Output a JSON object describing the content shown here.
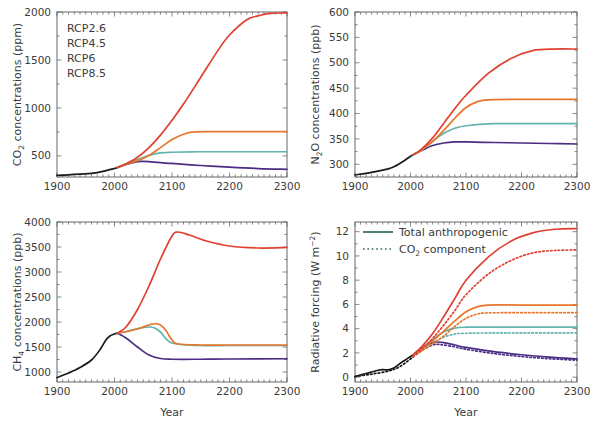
{
  "figure": {
    "title": "",
    "panels": [
      {
        "id": "co2",
        "ylabel_main": "CO",
        "ylabel_sub": "2",
        "ylabel_rest": " concentrations (ppm)",
        "xlabel": ""
      },
      {
        "id": "n2o",
        "ylabel_main": "N",
        "ylabel_sub": "2",
        "ylabel_mid": "O",
        "ylabel_rest": " concentrations (ppb)",
        "xlabel": ""
      },
      {
        "id": "ch4",
        "ylabel_main": "CH",
        "ylabel_sub": "4",
        "ylabel_rest": " concentrations (ppb)",
        "xlabel": "Year"
      },
      {
        "id": "rf",
        "ylabel_main": "Radiative forcing (W m",
        "ylabel_sup": "−2",
        "ylabel_rest": ")",
        "xlabel": "Year"
      }
    ]
  },
  "legend_scenarios": {
    "items": [
      {
        "label": "RCP2.6",
        "color": "#4b2d83"
      },
      {
        "label": "RCP4.5",
        "color": "#63b5ae"
      },
      {
        "label": "RCP6",
        "color": "#e8762c"
      },
      {
        "label": "RCP8.5",
        "color": "#e04030"
      }
    ]
  },
  "legend_forcing": {
    "items": [
      {
        "label": "Total anthropogenic",
        "style": "solid",
        "color": "#2f6b4f"
      },
      {
        "label": "CO",
        "sublabel": "2",
        "label_rest": " component",
        "style": "dotted",
        "color": "#2f6b4f"
      }
    ]
  },
  "colors": {
    "historical": "#1a1a1a",
    "rcp26": "#4b2d83",
    "rcp45": "#63b5ae",
    "rcp6": "#e8762c",
    "rcp85": "#e04030",
    "axis": "#58585a",
    "legend_green": "#2f6b4f"
  },
  "chart_data": [
    {
      "type": "line",
      "id": "co2",
      "title": "",
      "xlabel": "",
      "ylabel": "CO2 concentrations (ppm)",
      "xlim": [
        1900,
        2300
      ],
      "ylim": [
        280,
        2000
      ],
      "xticks": [
        1900,
        2000,
        2100,
        2200,
        2300
      ],
      "yticks": [
        500,
        1000,
        1500,
        2000
      ],
      "grid": false,
      "legend_position": "upper-left",
      "series": [
        {
          "name": "Historical",
          "color": "#1a1a1a",
          "x": [
            1900,
            1920,
            1940,
            1960,
            1980,
            1990,
            2000,
            2005
          ],
          "values": [
            296,
            303,
            311,
            317,
            339,
            354,
            369,
            379
          ]
        },
        {
          "name": "RCP2.6",
          "color": "#4b2d83",
          "x": [
            2005,
            2020,
            2040,
            2050,
            2060,
            2080,
            2100,
            2150,
            2200,
            2250,
            2300
          ],
          "values": [
            379,
            412,
            440,
            443,
            440,
            429,
            421,
            400,
            382,
            368,
            360
          ]
        },
        {
          "name": "RCP4.5",
          "color": "#63b5ae",
          "x": [
            2005,
            2020,
            2040,
            2060,
            2080,
            2100,
            2150,
            2200,
            2250,
            2300
          ],
          "values": [
            379,
            415,
            461,
            506,
            531,
            538,
            543,
            543,
            543,
            543
          ]
        },
        {
          "name": "RCP6",
          "color": "#e8762c",
          "x": [
            2005,
            2020,
            2040,
            2060,
            2080,
            2100,
            2120,
            2140,
            2200,
            2250,
            2300
          ],
          "values": [
            379,
            412,
            449,
            505,
            586,
            670,
            725,
            751,
            752,
            752,
            752
          ]
        },
        {
          "name": "RCP8.5",
          "color": "#e04030",
          "x": [
            2005,
            2020,
            2040,
            2060,
            2080,
            2100,
            2120,
            2150,
            2180,
            2200,
            2230,
            2250,
            2270,
            2300
          ],
          "values": [
            379,
            417,
            486,
            587,
            717,
            871,
            1040,
            1320,
            1600,
            1760,
            1920,
            1960,
            1985,
            1990
          ]
        }
      ]
    },
    {
      "type": "line",
      "id": "n2o",
      "title": "",
      "xlabel": "",
      "ylabel": "N2O concentrations (ppb)",
      "xlim": [
        1900,
        2300
      ],
      "ylim": [
        275,
        600
      ],
      "xticks": [
        1900,
        2000,
        2100,
        2200,
        2300
      ],
      "yticks": [
        300,
        350,
        400,
        450,
        500,
        550,
        600
      ],
      "grid": false,
      "series": [
        {
          "name": "Historical",
          "color": "#1a1a1a",
          "x": [
            1900,
            1930,
            1960,
            1970,
            1980,
            1990,
            2000,
            2005
          ],
          "values": [
            279,
            284,
            291,
            295,
            301,
            308,
            316,
            319
          ]
        },
        {
          "name": "RCP2.6",
          "color": "#4b2d83",
          "x": [
            2005,
            2020,
            2040,
            2060,
            2080,
            2100,
            2150,
            2200,
            2250,
            2300
          ],
          "values": [
            319,
            327,
            337,
            342,
            344,
            344,
            343,
            342,
            341,
            340
          ]
        },
        {
          "name": "RCP4.5",
          "color": "#63b5ae",
          "x": [
            2005,
            2020,
            2040,
            2060,
            2080,
            2100,
            2150,
            2200,
            2250,
            2300
          ],
          "values": [
            319,
            328,
            345,
            361,
            371,
            376,
            380,
            380,
            380,
            380
          ]
        },
        {
          "name": "RCP6",
          "color": "#e8762c",
          "x": [
            2005,
            2020,
            2040,
            2060,
            2080,
            2100,
            2120,
            2140,
            2200,
            2300
          ],
          "values": [
            319,
            328,
            345,
            367,
            391,
            412,
            423,
            427,
            428,
            428
          ]
        },
        {
          "name": "RCP8.5",
          "color": "#e04030",
          "x": [
            2005,
            2020,
            2040,
            2060,
            2080,
            2100,
            2140,
            2180,
            2220,
            2260,
            2300
          ],
          "values": [
            319,
            330,
            352,
            381,
            410,
            436,
            479,
            508,
            524,
            527,
            527
          ]
        }
      ]
    },
    {
      "type": "line",
      "id": "ch4",
      "title": "",
      "xlabel": "Year",
      "ylabel": "CH4 concentrations (ppb)",
      "xlim": [
        1900,
        2300
      ],
      "ylim": [
        800,
        4000
      ],
      "xticks": [
        1900,
        2000,
        2100,
        2200,
        2300
      ],
      "yticks": [
        1000,
        1500,
        2000,
        2500,
        3000,
        3500,
        4000
      ],
      "grid": false,
      "series": [
        {
          "name": "Historical",
          "color": "#1a1a1a",
          "x": [
            1900,
            1920,
            1940,
            1960,
            1975,
            1985,
            1992,
            2000,
            2005
          ],
          "values": [
            890,
            980,
            1090,
            1240,
            1450,
            1640,
            1720,
            1760,
            1775
          ]
        },
        {
          "name": "RCP2.6",
          "color": "#4b2d83",
          "x": [
            2005,
            2020,
            2040,
            2060,
            2080,
            2100,
            2150,
            2200,
            2300
          ],
          "values": [
            1775,
            1680,
            1500,
            1340,
            1270,
            1255,
            1255,
            1260,
            1265
          ]
        },
        {
          "name": "RCP4.5",
          "color": "#63b5ae",
          "x": [
            2005,
            2020,
            2040,
            2060,
            2070,
            2080,
            2100,
            2150,
            2200,
            2300
          ],
          "values": [
            1775,
            1810,
            1870,
            1900,
            1880,
            1800,
            1580,
            1530,
            1530,
            1530
          ]
        },
        {
          "name": "RCP6",
          "color": "#e8762c",
          "x": [
            2005,
            2020,
            2040,
            2060,
            2070,
            2080,
            2090,
            2100,
            2110,
            2150,
            2200,
            2300
          ],
          "values": [
            1775,
            1805,
            1860,
            1940,
            1965,
            1940,
            1820,
            1640,
            1560,
            1540,
            1540,
            1540
          ]
        },
        {
          "name": "RCP8.5",
          "color": "#e04030",
          "x": [
            2005,
            2020,
            2040,
            2060,
            2080,
            2100,
            2110,
            2130,
            2160,
            2200,
            2250,
            2300
          ],
          "values": [
            1775,
            1900,
            2250,
            2720,
            3260,
            3720,
            3800,
            3740,
            3620,
            3520,
            3480,
            3490
          ]
        }
      ]
    },
    {
      "type": "line",
      "id": "rf",
      "title": "",
      "xlabel": "Year",
      "ylabel": "Radiative forcing (W m-2)",
      "xlim": [
        1900,
        2300
      ],
      "ylim": [
        -0.4,
        12.8
      ],
      "xticks": [
        1900,
        2000,
        2100,
        2200,
        2300
      ],
      "yticks": [
        0,
        2,
        4,
        6,
        8,
        10,
        12
      ],
      "grid": false,
      "legend_position": "upper-left",
      "series": [
        {
          "name": "Historical total",
          "color": "#1a1a1a",
          "style": "solid",
          "x": [
            1900,
            1920,
            1940,
            1950,
            1960,
            1970,
            1980,
            1990,
            2000,
            2005
          ],
          "values": [
            0.05,
            0.3,
            0.55,
            0.62,
            0.6,
            0.75,
            1.1,
            1.4,
            1.7,
            1.85
          ]
        },
        {
          "name": "Historical CO2",
          "color": "#1a1a1a",
          "style": "dotted",
          "x": [
            1900,
            1930,
            1960,
            1980,
            2000,
            2005
          ],
          "values": [
            0.05,
            0.25,
            0.5,
            0.85,
            1.5,
            1.7
          ]
        },
        {
          "name": "RCP2.6 total",
          "color": "#4b2d83",
          "style": "solid",
          "x": [
            2005,
            2020,
            2040,
            2050,
            2060,
            2080,
            2100,
            2150,
            2200,
            2250,
            2300
          ],
          "values": [
            1.85,
            2.4,
            2.85,
            2.9,
            2.85,
            2.65,
            2.45,
            2.1,
            1.85,
            1.65,
            1.5
          ]
        },
        {
          "name": "RCP2.6 CO2",
          "color": "#4b2d83",
          "style": "dotted",
          "x": [
            2005,
            2020,
            2040,
            2050,
            2060,
            2080,
            2100,
            2150,
            2200,
            2250,
            2300
          ],
          "values": [
            1.7,
            2.2,
            2.65,
            2.7,
            2.65,
            2.5,
            2.3,
            1.95,
            1.7,
            1.52,
            1.4
          ]
        },
        {
          "name": "RCP4.5 total",
          "color": "#63b5ae",
          "style": "solid",
          "x": [
            2005,
            2020,
            2040,
            2060,
            2080,
            2100,
            2150,
            2200,
            2300
          ],
          "values": [
            1.85,
            2.4,
            3.1,
            3.75,
            4.05,
            4.12,
            4.12,
            4.12,
            4.12
          ]
        },
        {
          "name": "RCP4.5 CO2",
          "color": "#63b5ae",
          "style": "dotted",
          "x": [
            2005,
            2020,
            2040,
            2060,
            2080,
            2100,
            2150,
            2200,
            2300
          ],
          "values": [
            1.7,
            2.2,
            2.8,
            3.3,
            3.55,
            3.62,
            3.65,
            3.65,
            3.65
          ]
        },
        {
          "name": "RCP6 total",
          "color": "#e8762c",
          "style": "solid",
          "x": [
            2005,
            2020,
            2040,
            2060,
            2080,
            2100,
            2120,
            2140,
            2200,
            2300
          ],
          "values": [
            1.85,
            2.35,
            3.0,
            3.8,
            4.65,
            5.4,
            5.8,
            5.95,
            5.95,
            5.95
          ]
        },
        {
          "name": "RCP6 CO2",
          "color": "#e8762c",
          "style": "dotted",
          "x": [
            2005,
            2020,
            2040,
            2060,
            2080,
            2100,
            2120,
            2140,
            2200,
            2300
          ],
          "values": [
            1.7,
            2.15,
            2.75,
            3.4,
            4.2,
            4.85,
            5.2,
            5.3,
            5.32,
            5.32
          ]
        },
        {
          "name": "RCP8.5 total",
          "color": "#e04030",
          "style": "solid",
          "x": [
            2005,
            2020,
            2040,
            2060,
            2080,
            2100,
            2140,
            2180,
            2220,
            2260,
            2300
          ],
          "values": [
            1.85,
            2.5,
            3.6,
            5.0,
            6.5,
            8.0,
            9.9,
            11.2,
            11.9,
            12.2,
            12.25
          ]
        },
        {
          "name": "RCP8.5 CO2",
          "color": "#e04030",
          "style": "dotted",
          "x": [
            2005,
            2020,
            2040,
            2060,
            2080,
            2100,
            2140,
            2180,
            2220,
            2260,
            2300
          ],
          "values": [
            1.7,
            2.3,
            3.2,
            4.3,
            5.5,
            6.8,
            8.5,
            9.6,
            10.25,
            10.45,
            10.5
          ]
        }
      ]
    }
  ]
}
